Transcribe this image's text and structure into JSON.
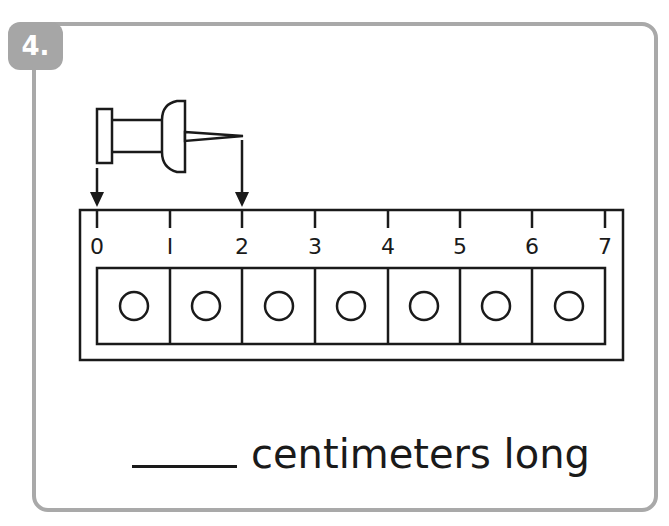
{
  "problem": {
    "number_label": "4.",
    "answer_blank": "",
    "answer_suffix": "centimeters long"
  },
  "ruler": {
    "unit": "centimeters",
    "tick_labels": [
      "0",
      "I",
      "2",
      "3",
      "4",
      "5",
      "6",
      "7"
    ],
    "cells": 7
  },
  "object": {
    "name": "push pin",
    "start_mark": 0,
    "end_mark": 2
  },
  "colors": {
    "frame": "#a9a9a9",
    "badge": "#a6a6a6",
    "ink": "#1a1a1a"
  }
}
